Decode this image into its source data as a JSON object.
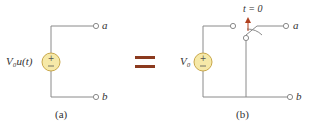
{
  "figure": {
    "left": {
      "source_label": "V₀u(t)",
      "terminal_a": "a",
      "terminal_b": "b",
      "caption": "(a)"
    },
    "equals": "=",
    "right": {
      "source_label": "V₀",
      "switch_label": "t = 0",
      "terminal_a": "a",
      "terminal_b": "b",
      "caption": "(b)"
    },
    "colors": {
      "wire": "#8a8a8a",
      "source_fill": "#f6e9a8",
      "source_stroke": "#c9a84a",
      "equals": "#8b3a1e",
      "switch_arrow": "#b0401f"
    }
  }
}
